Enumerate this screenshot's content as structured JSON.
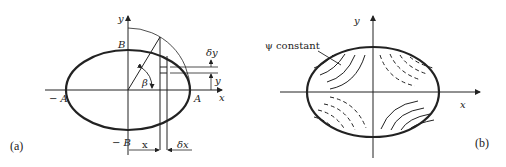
{
  "panel_a": {
    "tag": "(a)",
    "labels": {
      "y_axis": "y",
      "x_axis": "x",
      "B": "B",
      "neg_B": "− B",
      "A": "A",
      "neg_A": "− A",
      "beta": "β",
      "delta_y": "δy",
      "y_dim": "y",
      "x_dim": "x",
      "delta_x": "δx"
    }
  },
  "panel_b": {
    "tag": "(b)",
    "labels": {
      "y_axis": "y",
      "x_axis": "x",
      "psi_constant": "ψ constant"
    }
  },
  "colors": {
    "ink": "#222222",
    "background": "#ffffff"
  }
}
